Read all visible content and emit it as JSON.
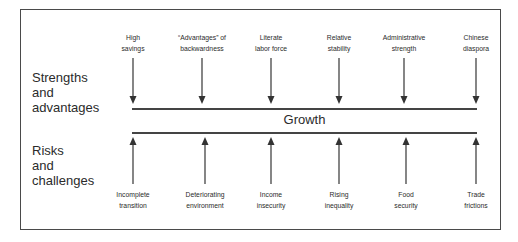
{
  "diagram": {
    "center_label": "Growth",
    "strengths": {
      "heading_lines": [
        "Strengths",
        "and",
        "advantages"
      ],
      "items": [
        {
          "line1": "High",
          "line2": "savings"
        },
        {
          "line1": "“Advantages” of",
          "line2": "backwardness"
        },
        {
          "line1": "Literate",
          "line2": "labor force"
        },
        {
          "line1": "Relative",
          "line2": "stability"
        },
        {
          "line1": "Administrative",
          "line2": "strength"
        },
        {
          "line1": "Chinese",
          "line2": "diaspora"
        }
      ]
    },
    "risks": {
      "heading_lines": [
        "Risks",
        "and",
        "challenges"
      ],
      "items": [
        {
          "line1": "Incomplete",
          "line2": "transition"
        },
        {
          "line1": "Deteriorating",
          "line2": "environment"
        },
        {
          "line1": "Income",
          "line2": "insecurity"
        },
        {
          "line1": "Rising",
          "line2": "inequality"
        },
        {
          "line1": "Food",
          "line2": "security"
        },
        {
          "line1": "Trade",
          "line2": "frictions"
        }
      ]
    }
  }
}
